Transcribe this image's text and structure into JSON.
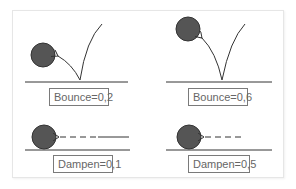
{
  "diagram": {
    "title": "",
    "colors": {
      "ball": "#555555",
      "ball_stroke": "#333333",
      "line": "#333333",
      "label_border": "#7a7a7a",
      "label_text": "#666666",
      "frame": "#e6e6e6"
    },
    "panels": [
      {
        "id": "bounce-low",
        "kind": "bounce",
        "label": "Bounce=0,2",
        "parameter": "Bounce",
        "value": "0,2"
      },
      {
        "id": "bounce-high",
        "kind": "bounce",
        "label": "Bounce=0,6",
        "parameter": "Bounce",
        "value": "0,6"
      },
      {
        "id": "dampen-low",
        "kind": "dampen",
        "label": "Dampen=0,1",
        "parameter": "Dampen",
        "value": "0,1"
      },
      {
        "id": "dampen-high",
        "kind": "dampen",
        "label": "Dampen=0,5",
        "parameter": "Dampen",
        "value": "0,5"
      }
    ]
  }
}
